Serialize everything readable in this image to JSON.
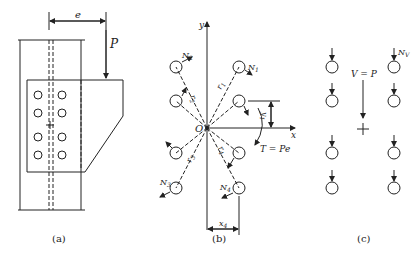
{
  "figure_a": {
    "caption": "(a)",
    "labels": {
      "eccentricity": "e",
      "load": "P"
    }
  },
  "figure_b": {
    "caption": "(b)",
    "labels": {
      "y_axis": "y",
      "x_axis": "x",
      "origin": "O",
      "N1": "N1",
      "N2": "N2",
      "N3": "N3",
      "N4": "N4",
      "r1": "r1",
      "r2": "r2",
      "r3": "r3",
      "r4": "r4",
      "y1": "y1",
      "x4": "x4",
      "torque": "T = Pe"
    }
  },
  "figure_c": {
    "caption": "(c)",
    "labels": {
      "shear": "V = P",
      "bolt_force": "Nv"
    }
  },
  "colors": {
    "line": "#222222",
    "background": "#ffffff"
  }
}
